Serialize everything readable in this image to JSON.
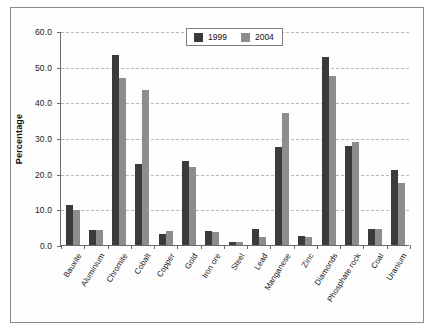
{
  "chart_data": {
    "type": "bar",
    "title": "",
    "xlabel": "",
    "ylabel": "Percentage",
    "ylim": [
      0,
      60
    ],
    "ytick_step": 10,
    "ytick_labels": [
      "0.0",
      "10.0",
      "20.0",
      "30.0",
      "40.0",
      "50.0",
      "60.0"
    ],
    "grid": true,
    "legend_position": "top-right",
    "categories": [
      "Bauxite",
      "Aluminium",
      "Chromite",
      "Cobalt",
      "Copper",
      "Gold",
      "Iron ore",
      "Steel",
      "Lead",
      "Manganese",
      "Zinc",
      "Diamonds",
      "Phosphate rock",
      "Coal",
      "Uranium"
    ],
    "series": [
      {
        "name": "1999",
        "color": "#3b3b3b",
        "values": [
          11.2,
          4.1,
          53.4,
          22.7,
          3.2,
          23.5,
          4.0,
          0.9,
          4.5,
          27.6,
          2.6,
          52.8,
          27.8,
          4.6,
          21.0
        ]
      },
      {
        "name": "2004",
        "color": "#8d8d8d",
        "values": [
          9.8,
          4.3,
          46.8,
          43.5,
          3.8,
          21.8,
          3.7,
          0.8,
          2.3,
          36.9,
          2.3,
          47.3,
          29.0,
          4.6,
          17.5
        ]
      }
    ]
  },
  "legend": {
    "entries": [
      {
        "label": "1999",
        "color": "#3b3b3b"
      },
      {
        "label": "2004",
        "color": "#8d8d8d"
      }
    ]
  },
  "colors": {
    "series_1999": "#3b3b3b",
    "series_2004": "#8d8d8d",
    "axis": "#6a6a6a",
    "grid": "#b9b9b9",
    "frame": "#8a8a8a",
    "background": "#ffffff"
  }
}
